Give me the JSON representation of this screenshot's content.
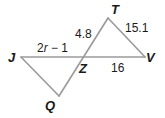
{
  "figure": {
    "type": "two triangles sharing intersection point Z",
    "colors": {
      "edge": "#9a9a9a",
      "label": "#1a1a1a",
      "background": "#ffffff"
    },
    "vertices": {
      "J": {
        "label": "J",
        "x": 21,
        "y": 57
      },
      "Z": {
        "label": "Z",
        "x": 83,
        "y": 57
      },
      "V": {
        "label": "V",
        "x": 145,
        "y": 57
      },
      "T": {
        "label": "T",
        "x": 108,
        "y": 18
      },
      "Q": {
        "label": "Q",
        "x": 59,
        "y": 96
      }
    },
    "segments": [
      {
        "from": "J",
        "to": "V"
      },
      {
        "from": "Q",
        "to": "T"
      },
      {
        "from": "J",
        "to": "Q"
      },
      {
        "from": "T",
        "to": "V"
      }
    ],
    "measures": {
      "JZ": {
        "prefix": "2",
        "variable": "r",
        "suffix": " − 1"
      },
      "ZT": "4.8",
      "TV": "15.1",
      "ZV": "16"
    }
  }
}
